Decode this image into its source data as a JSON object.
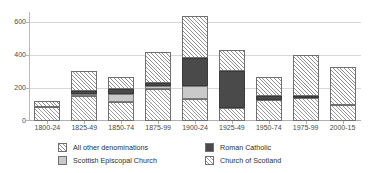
{
  "chart_data": {
    "type": "bar",
    "subtype": "stacked-vertical",
    "title": "",
    "subtitle": "",
    "xlabel": "",
    "ylabel": "",
    "ylim": [
      0,
      660
    ],
    "yticks": [
      0,
      200,
      400,
      600
    ],
    "ytick_labels": [
      "0",
      "200",
      "400",
      "600"
    ],
    "grid": "horizontal",
    "legend_position": "bottom",
    "legend_columns": 2,
    "categories": [
      "1800-24",
      "1825-49",
      "1850-74",
      "1875-99",
      "1900-24",
      "1925-49",
      "1950-74",
      "1975-99",
      "2000-15"
    ],
    "series": [
      {
        "name": "Church of Scotland",
        "pattern": "diagonal-hatch",
        "color": "#ffffff",
        "values": [
          85,
          150,
          115,
          195,
          135,
          78,
          125,
          140,
          98
        ]
      },
      {
        "name": "Scottish Episcopal Church",
        "pattern": "solid-light-grey",
        "color": "#c9c9c9",
        "values": [
          0,
          12,
          50,
          15,
          80,
          0,
          0,
          0,
          0
        ]
      },
      {
        "name": "Roman Catholic",
        "pattern": "solid-dark-grey",
        "color": "#4a4a4a",
        "values": [
          0,
          18,
          30,
          20,
          165,
          225,
          25,
          10,
          0
        ]
      },
      {
        "name": "All other denominations",
        "pattern": "cross-hatch",
        "color": "#ffffff",
        "values": [
          35,
          125,
          70,
          185,
          255,
          130,
          115,
          248,
          228
        ]
      }
    ],
    "totals": [
      120,
      305,
      265,
      415,
      635,
      433,
      265,
      398,
      326
    ]
  },
  "legend": {
    "items": [
      {
        "label": "All other denominations",
        "swatch": "cross-hatch-swatch"
      },
      {
        "label": "Roman Catholic",
        "swatch": "dark-solid-swatch"
      },
      {
        "label": "Scottish Episcopal Church",
        "swatch": "light-grey-swatch"
      },
      {
        "label": "Church of Scotland",
        "swatch": "diagonal-hatch-swatch"
      }
    ]
  },
  "colors": {
    "roman_catholic": "#4a4a4a",
    "scottish_episcopal": "#c9c9c9",
    "hatch_line": "#8f8f8f",
    "axis": "#b0b0b0",
    "gridline": "#d8d8d8",
    "text": "#3a3a3a"
  }
}
